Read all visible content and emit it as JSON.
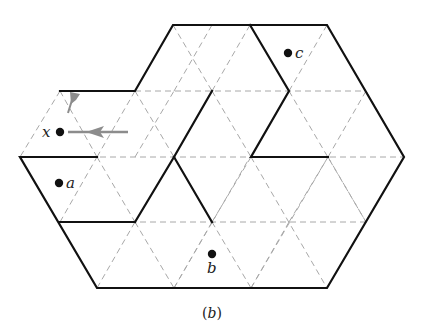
{
  "figure": {
    "caption_open": "(",
    "caption_letter": "b",
    "caption_close": ")"
  },
  "points": [
    {
      "id": "x",
      "label": "x",
      "cx": 59,
      "cy": 132,
      "label_side": "left"
    },
    {
      "id": "a",
      "label": "a",
      "cx": 59,
      "cy": 182,
      "label_side": "right"
    },
    {
      "id": "b",
      "label": "b",
      "cx": 212,
      "cy": 254,
      "label_side": "below"
    },
    {
      "id": "c",
      "label": "c",
      "cx": 288,
      "cy": 52,
      "label_side": "right"
    }
  ],
  "colors": {
    "wall": "#111111",
    "grid": "#a8a8a8",
    "arrow": "#8c8c8c",
    "background": "#ffffff"
  },
  "lattice": {
    "side": 77,
    "row_height": 66,
    "rows_y": [
      25,
      91,
      157,
      222,
      288
    ]
  }
}
